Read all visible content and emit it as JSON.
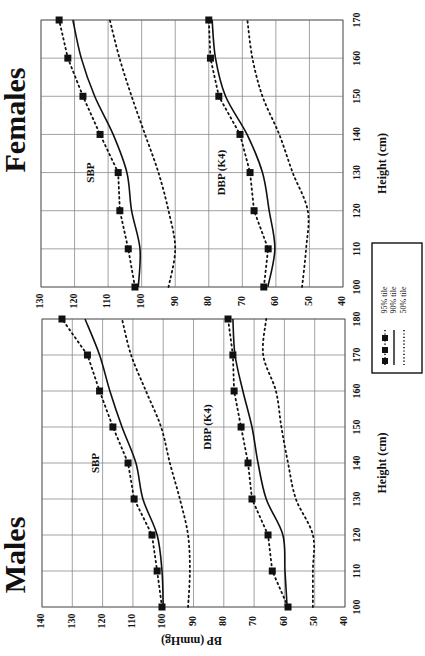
{
  "figure": {
    "orientation": "rotated-90-ccw",
    "legend": {
      "items": [
        {
          "label": "95% tile",
          "style": "dotted-with-squares"
        },
        {
          "label": "90% tile",
          "style": "solid"
        },
        {
          "label": "50% tile",
          "style": "dotted"
        }
      ]
    },
    "colors": {
      "line": "#111111",
      "grid": "#8a8a8a",
      "background": "#ffffff"
    }
  },
  "chart_data": [
    {
      "type": "line",
      "title": "Males",
      "xlabel": "Height (cm)",
      "ylabel": "BP (mmHg)",
      "x": [
        100,
        110,
        120,
        130,
        140,
        150,
        160,
        170,
        180
      ],
      "xlim": [
        100,
        180
      ],
      "ylim": [
        40,
        140
      ],
      "xticks": [
        100,
        110,
        120,
        130,
        140,
        150,
        160,
        170,
        180
      ],
      "yticks": [
        40,
        50,
        60,
        70,
        80,
        90,
        100,
        110,
        120,
        130,
        140
      ],
      "grid": true,
      "annotations": [
        {
          "text": "SBP",
          "x": 140,
          "y": 122
        },
        {
          "text": "DBP (K4)",
          "x": 150,
          "y": 85
        }
      ],
      "series": [
        {
          "name": "SBP 95% tile",
          "style": "dotted-with-squares",
          "values": [
            100.4,
            102,
            103.7,
            109.6,
            111.6,
            116.6,
            121,
            125,
            133.4
          ]
        },
        {
          "name": "SBP 90% tile",
          "style": "solid",
          "values": [
            100,
            100.4,
            102,
            106.7,
            109,
            113.6,
            117.6,
            121,
            125.8
          ]
        },
        {
          "name": "SBP 50% tile",
          "style": "dotted",
          "values": [
            91.8,
            91.2,
            91.8,
            94.5,
            97.8,
            100.7,
            105.7,
            110.6,
            113.6
          ]
        },
        {
          "name": "DBP (K4) 95% tile",
          "style": "dotted-with-squares",
          "values": [
            58.8,
            64,
            65.4,
            70.7,
            72,
            74.3,
            76.6,
            77,
            78.6
          ]
        },
        {
          "name": "DBP (K4) 90% tile",
          "style": "solid",
          "values": [
            59.1,
            59.8,
            60.5,
            66,
            68.7,
            70.7,
            73.7,
            76.3,
            77
          ]
        },
        {
          "name": "DBP (K4) 50% tile",
          "style": "dotted",
          "values": [
            50.6,
            50.6,
            50.6,
            56.2,
            58.8,
            61,
            62.8,
            67,
            66
          ]
        }
      ]
    },
    {
      "type": "line",
      "title": "Females",
      "xlabel": "Height (cm)",
      "ylabel": "",
      "x": [
        100,
        110,
        120,
        130,
        140,
        150,
        160,
        170
      ],
      "xlim": [
        100,
        170
      ],
      "ylim": [
        40,
        130
      ],
      "xticks": [
        100,
        110,
        120,
        130,
        140,
        150,
        160,
        170
      ],
      "yticks": [
        40,
        50,
        60,
        70,
        80,
        90,
        100,
        110,
        120,
        130
      ],
      "grid": true,
      "annotations": [
        {
          "text": "SBP",
          "x": 130,
          "y": 115
        },
        {
          "text": "DBP (K4)",
          "x": 130,
          "y": 76
        }
      ],
      "series": [
        {
          "name": "SBP 95% tile",
          "style": "dotted-with-squares",
          "values": [
            102,
            104,
            106.5,
            107,
            112.4,
            117.5,
            122,
            124.6
          ]
        },
        {
          "name": "SBP 90% tile",
          "style": "solid",
          "values": [
            101,
            100.5,
            103,
            104.4,
            108.5,
            114,
            118,
            120.5
          ]
        },
        {
          "name": "SBP 50% tile",
          "style": "dotted",
          "values": [
            92,
            90,
            92,
            95,
            99,
            103,
            106.6,
            109.5
          ]
        },
        {
          "name": "DBP (K4) 95% tile",
          "style": "dotted-with-squares",
          "values": [
            63.6,
            62.3,
            66.5,
            67.7,
            70.7,
            77,
            79.5,
            80
          ]
        },
        {
          "name": "DBP (K4) 90% tile",
          "style": "solid",
          "values": [
            62.4,
            60.3,
            62,
            64,
            68.6,
            75,
            78,
            79
          ]
        },
        {
          "name": "DBP (K4) 50% tile",
          "style": "dotted",
          "values": [
            52.2,
            51,
            50.5,
            55,
            59,
            64,
            67,
            68.5
          ]
        }
      ]
    }
  ]
}
